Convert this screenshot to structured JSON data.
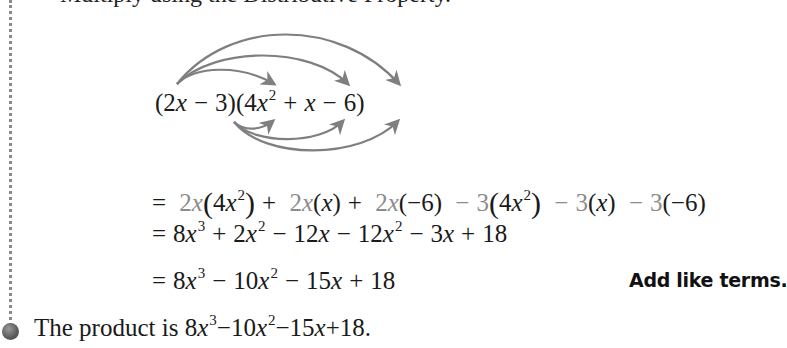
{
  "heading_partial": "Multiply using the Distributive Property.",
  "expression": {
    "factor1": "(2x − 3)",
    "factor2": "(4x² + x − 6)",
    "parts": {
      "open1": "(2",
      "var_x": "x",
      "minus": "−",
      "three": "3)",
      "open2": "(4",
      "x2_exp": "2",
      "plus": "+",
      "six": "6)"
    }
  },
  "arrows": {
    "color": "#7f7f7f",
    "from_2x_to": [
      "4x²",
      "x",
      "−6"
    ],
    "from_neg3_to": [
      "4x²",
      "x",
      "−6"
    ]
  },
  "steps": [
    {
      "label": "= 2x(4x²) + 2x(x) + 2x(−6) − 3(4x²) − 3(x) − 3(−6)",
      "highlight_color": "#8c8c8c"
    },
    {
      "label": "= 8x³ + 2x² − 12x − 12x² − 3x + 18"
    },
    {
      "label": "= 8x³ − 10x² − 15x + 18",
      "note": "Add like terms."
    }
  ],
  "conclusion": {
    "prefix": "The product is ",
    "result": "8x³ − 10x² − 15x + 18."
  },
  "sym": {
    "eq": "=",
    "plus": "+",
    "minus": "−",
    "x": "x",
    "lp": "(",
    "rp": ")",
    "two": "2",
    "three": "3",
    "four": "4",
    "six": "6",
    "eight": "8",
    "ten": "10",
    "twelve": "12",
    "fifteen": "15",
    "eighteen": "18",
    "neg6": "−6",
    "dot": "."
  }
}
